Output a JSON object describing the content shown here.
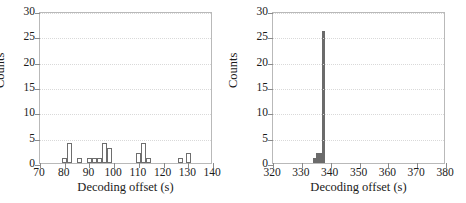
{
  "figure": {
    "background": "#ffffff",
    "panel_count": 2
  },
  "chart_data": [
    {
      "type": "bar",
      "panel": "left",
      "title": "",
      "xlabel": "Decoding offset (s)",
      "ylabel": "Counts",
      "xlim": [
        70,
        140
      ],
      "ylim": [
        0,
        30
      ],
      "xticks": [
        70,
        80,
        90,
        100,
        110,
        120,
        130,
        140
      ],
      "yticks": [
        0,
        5,
        10,
        15,
        20,
        25,
        30
      ],
      "grid": true,
      "grid_axis": "y",
      "bar_style": "hollow",
      "bar_edge_color": "#6e6e6e",
      "bar_fill_color": "#ffffff",
      "bin_width": 2,
      "bins": [
        79,
        81,
        85,
        89,
        91,
        93,
        95,
        97,
        109,
        111,
        113,
        126,
        129
      ],
      "values": [
        1,
        4,
        1,
        1,
        1,
        1,
        4,
        3,
        2,
        4,
        1,
        1,
        2
      ]
    },
    {
      "type": "bar",
      "panel": "right",
      "title": "",
      "xlabel": "Decoding offset (s)",
      "ylabel": "Counts",
      "xlim": [
        320,
        380
      ],
      "ylim": [
        0,
        30
      ],
      "xticks": [
        320,
        330,
        340,
        350,
        360,
        370,
        380
      ],
      "yticks": [
        0,
        5,
        10,
        15,
        20,
        25,
        30
      ],
      "grid": true,
      "grid_axis": "y",
      "bar_style": "filled",
      "bar_edge_color": "#6b6b6b",
      "bar_fill_color": "#6b6b6b",
      "bin_width": 1,
      "bins": [
        334,
        335,
        336,
        337
      ],
      "values": [
        1,
        2,
        2,
        26
      ]
    }
  ]
}
